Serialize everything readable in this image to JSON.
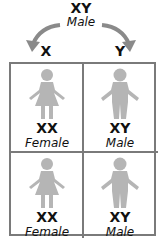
{
  "parent": {
    "genotype": "XY",
    "sex": "Male"
  },
  "gametes": [
    {
      "label": "X"
    },
    {
      "label": "Y"
    }
  ],
  "cells": [
    {
      "genotype": "XX",
      "sex": "Female",
      "figure": "female-figure-icon"
    },
    {
      "genotype": "XY",
      "sex": "Male",
      "figure": "male-figure-icon"
    },
    {
      "genotype": "XX",
      "sex": "Female",
      "figure": "female-figure-icon"
    },
    {
      "genotype": "XY",
      "sex": "Male",
      "figure": "male-figure-icon"
    }
  ],
  "colors": {
    "frame": "#7a7a7a",
    "figure": "#b5b5b5",
    "arrow": "#8a8a8a",
    "text": "#111111"
  }
}
